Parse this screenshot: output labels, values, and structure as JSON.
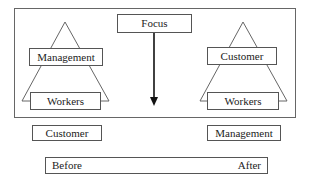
{
  "diagram": {
    "focus_label": "Focus",
    "before": {
      "pyramid_top": "Management",
      "pyramid_bottom": "Workers",
      "outside": "Customer"
    },
    "after": {
      "pyramid_top": "Customer",
      "pyramid_bottom": "Workers",
      "outside": "Management"
    },
    "timeline": {
      "start_label": "Before",
      "end_label": "After"
    },
    "colors": {
      "line": "#555555",
      "text": "#222222",
      "background": "#ffffff"
    }
  }
}
